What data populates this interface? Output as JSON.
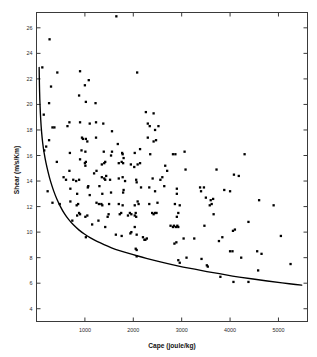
{
  "chart_data": {
    "type": "scatter",
    "title": "",
    "xlabel": "Cape (joule/kg)",
    "ylabel": "Shear (m/s/Km)",
    "xlim": [
      0,
      5600
    ],
    "ylim": [
      3.0,
      27.2
    ],
    "xticks": [
      1000,
      2000,
      3000,
      4000,
      5000
    ],
    "xticklabels": [
      "1000",
      "2000",
      "3000",
      "4000",
      "5000"
    ],
    "yticks": [
      4,
      6,
      8,
      10,
      12,
      14,
      16,
      18,
      20,
      22,
      24,
      26
    ],
    "yticklabels": [
      "4",
      "6",
      "8",
      "10",
      "12",
      "14",
      "16",
      "18",
      "20",
      "22",
      "24",
      "26"
    ],
    "grid": false,
    "legend": null,
    "frame": "box-all-sides-with-inward-ticks",
    "marker": "filled-square",
    "marker_color": "#000000",
    "series": [
      {
        "name": "observations",
        "points": [
          [
            1650,
            26.9
          ],
          [
            270,
            25.1
          ],
          [
            120,
            22.9
          ],
          [
            430,
            22.5
          ],
          [
            900,
            22.6
          ],
          [
            2080,
            22.5
          ],
          [
            1000,
            21.5
          ],
          [
            1080,
            21.9
          ],
          [
            300,
            21.4
          ],
          [
            880,
            20.7
          ],
          [
            1020,
            20.2
          ],
          [
            1220,
            20.1
          ],
          [
            260,
            20.1
          ],
          [
            150,
            19.2
          ],
          [
            680,
            18.6
          ],
          [
            900,
            18.6
          ],
          [
            1100,
            18.5
          ],
          [
            1230,
            18.6
          ],
          [
            330,
            18.2
          ],
          [
            370,
            18.2
          ],
          [
            640,
            18.3
          ],
          [
            1380,
            18.5
          ],
          [
            2300,
            18.5
          ],
          [
            2340,
            18.3
          ],
          [
            2520,
            18.3
          ],
          [
            2260,
            19.4
          ],
          [
            2420,
            19.3
          ],
          [
            2450,
            18.0
          ],
          [
            1560,
            17.9
          ],
          [
            940,
            17.4
          ],
          [
            960,
            17.3
          ],
          [
            1020,
            17.3
          ],
          [
            1050,
            17.1
          ],
          [
            260,
            17.2
          ],
          [
            200,
            16.7
          ],
          [
            1230,
            17.4
          ],
          [
            2300,
            17.4
          ],
          [
            2420,
            17.1
          ],
          [
            2470,
            17.2
          ],
          [
            1680,
            16.9
          ],
          [
            160,
            16.4
          ],
          [
            930,
            16.4
          ],
          [
            1010,
            16.3
          ],
          [
            690,
            16.2
          ],
          [
            1390,
            16.3
          ],
          [
            1560,
            16.3
          ],
          [
            1770,
            16.2
          ],
          [
            1780,
            16.1
          ],
          [
            2030,
            16.2
          ],
          [
            2350,
            16.1
          ],
          [
            2820,
            16.1
          ],
          [
            2870,
            16.1
          ],
          [
            3060,
            16.3
          ],
          [
            4300,
            16.1
          ],
          [
            420,
            15.5
          ],
          [
            900,
            15.7
          ],
          [
            1000,
            15.4
          ],
          [
            1010,
            15.2
          ],
          [
            1020,
            15.5
          ],
          [
            1350,
            15.3
          ],
          [
            1400,
            15.4
          ],
          [
            1420,
            15.5
          ],
          [
            1700,
            15.4
          ],
          [
            1760,
            15.5
          ],
          [
            1790,
            15.4
          ],
          [
            1950,
            15.3
          ],
          [
            2020,
            15.1
          ],
          [
            2090,
            15.3
          ],
          [
            2140,
            15.4
          ],
          [
            2660,
            15.2
          ],
          [
            2700,
            14.8
          ],
          [
            3080,
            14.9
          ],
          [
            3720,
            14.9
          ],
          [
            4080,
            14.5
          ],
          [
            4180,
            14.4
          ],
          [
            560,
            14.3
          ],
          [
            610,
            14.1
          ],
          [
            760,
            14.1
          ],
          [
            820,
            14.0
          ],
          [
            880,
            14.1
          ],
          [
            1060,
            13.5
          ],
          [
            1070,
            13.6
          ],
          [
            1300,
            13.6
          ],
          [
            1350,
            14.3
          ],
          [
            1400,
            14.2
          ],
          [
            1420,
            14.1
          ],
          [
            1440,
            14.4
          ],
          [
            1520,
            14.1
          ],
          [
            1700,
            14.2
          ],
          [
            1780,
            14.3
          ],
          [
            1830,
            14.0
          ],
          [
            2060,
            14.1
          ],
          [
            2070,
            13.9
          ],
          [
            2400,
            14.2
          ],
          [
            2600,
            14.3
          ],
          [
            2640,
            13.6
          ],
          [
            2900,
            13.4
          ],
          [
            3380,
            13.5
          ],
          [
            3400,
            13.2
          ],
          [
            3460,
            13.5
          ],
          [
            3880,
            13.3
          ],
          [
            4000,
            13.2
          ],
          [
            230,
            13.2
          ],
          [
            700,
            13.4
          ],
          [
            840,
            13.0
          ],
          [
            1360,
            13.0
          ],
          [
            1790,
            13.1
          ],
          [
            1800,
            13.3
          ],
          [
            2160,
            13.5
          ],
          [
            2330,
            13.5
          ],
          [
            2450,
            13.2
          ],
          [
            2900,
            13.0
          ],
          [
            3500,
            12.7
          ],
          [
            3600,
            12.5
          ],
          [
            3650,
            12.6
          ],
          [
            4600,
            12.5
          ],
          [
            4900,
            12.1
          ],
          [
            330,
            12.3
          ],
          [
            480,
            12.2
          ],
          [
            830,
            12.1
          ],
          [
            1240,
            12.3
          ],
          [
            1290,
            12.2
          ],
          [
            1340,
            12.2
          ],
          [
            1360,
            12.1
          ],
          [
            1500,
            12.2
          ],
          [
            1700,
            12.2
          ],
          [
            1780,
            12.1
          ],
          [
            2030,
            12.1
          ],
          [
            2090,
            12.4
          ],
          [
            2110,
            12.2
          ],
          [
            2330,
            12.2
          ],
          [
            2500,
            12.3
          ],
          [
            2860,
            12.2
          ],
          [
            2960,
            12.1
          ],
          [
            3580,
            12.1
          ],
          [
            3620,
            12.2
          ],
          [
            840,
            11.3
          ],
          [
            880,
            11.5
          ],
          [
            900,
            11.4
          ],
          [
            1010,
            11.2
          ],
          [
            1050,
            11.3
          ],
          [
            1470,
            11.2
          ],
          [
            1490,
            11.4
          ],
          [
            1720,
            11.4
          ],
          [
            1750,
            11.5
          ],
          [
            1890,
            11.3
          ],
          [
            1930,
            11.5
          ],
          [
            1960,
            11.4
          ],
          [
            2030,
            11.3
          ],
          [
            2050,
            11.5
          ],
          [
            2060,
            11.2
          ],
          [
            2390,
            11.5
          ],
          [
            2420,
            11.4
          ],
          [
            2450,
            11.5
          ],
          [
            2480,
            11.5
          ],
          [
            2900,
            11.2
          ],
          [
            2930,
            11.5
          ],
          [
            3660,
            11.4
          ],
          [
            4380,
            10.8
          ],
          [
            740,
            10.9
          ],
          [
            1150,
            10.6
          ],
          [
            1280,
            10.9
          ],
          [
            1420,
            10.4
          ],
          [
            2030,
            10.4
          ],
          [
            2770,
            10.5
          ],
          [
            2820,
            10.4
          ],
          [
            2840,
            10.5
          ],
          [
            2880,
            10.4
          ],
          [
            2910,
            10.5
          ],
          [
            2930,
            10.4
          ],
          [
            3470,
            10.5
          ],
          [
            4060,
            10.1
          ],
          [
            4100,
            10.2
          ],
          [
            1640,
            9.8
          ],
          [
            1760,
            9.7
          ],
          [
            1940,
            9.9
          ],
          [
            1960,
            10.0
          ],
          [
            2070,
            9.8
          ],
          [
            2200,
            9.6
          ],
          [
            2230,
            9.4
          ],
          [
            2250,
            9.4
          ],
          [
            2280,
            9.5
          ],
          [
            1020,
            9.6
          ],
          [
            2850,
            9.1
          ],
          [
            2890,
            9.2
          ],
          [
            3040,
            9.5
          ],
          [
            3260,
            9.5
          ],
          [
            3770,
            9.3
          ],
          [
            3840,
            9.6
          ],
          [
            4000,
            8.5
          ],
          [
            4050,
            8.5
          ],
          [
            4560,
            8.5
          ],
          [
            4650,
            8.3
          ],
          [
            2050,
            8.7
          ],
          [
            2070,
            8.6
          ],
          [
            2070,
            8.1
          ],
          [
            2930,
            7.8
          ],
          [
            2960,
            7.6
          ],
          [
            3100,
            8.0
          ],
          [
            3410,
            7.9
          ],
          [
            3520,
            7.4
          ],
          [
            3540,
            7.3
          ],
          [
            4580,
            7.0
          ],
          [
            5250,
            7.5
          ],
          [
            3800,
            6.5
          ],
          [
            4070,
            6.1
          ],
          [
            4380,
            6.1
          ],
          [
            5050,
            9.7
          ],
          [
            4230,
            8.0
          ],
          [
            1540,
            16.0
          ],
          [
            2140,
            16.5
          ],
          [
            2560,
            14.1
          ],
          [
            1800,
            15.8
          ],
          [
            1540,
            13.1
          ],
          [
            1100,
            12.9
          ],
          [
            1190,
            14.6
          ],
          [
            1240,
            14.8
          ],
          [
            680,
            14.8
          ],
          [
            700,
            12.4
          ],
          [
            860,
            12.2
          ]
        ]
      }
    ],
    "fit_curve": {
      "name": "lower-bound envelope",
      "style": "solid-black-line",
      "description": "monotonically decreasing hyperbolic-like curve from ~22.9 at the left axis down to ~5.9 at the right axis",
      "points": [
        [
          55,
          22.9
        ],
        [
          60,
          21.6
        ],
        [
          68,
          20.4
        ],
        [
          80,
          19.3
        ],
        [
          95,
          18.3
        ],
        [
          115,
          17.4
        ],
        [
          140,
          16.6
        ],
        [
          175,
          15.8
        ],
        [
          215,
          15.1
        ],
        [
          265,
          14.3
        ],
        [
          320,
          13.6
        ],
        [
          385,
          12.9
        ],
        [
          455,
          12.3
        ],
        [
          535,
          11.7
        ],
        [
          620,
          11.2
        ],
        [
          715,
          10.75
        ],
        [
          820,
          10.35
        ],
        [
          930,
          10.0
        ],
        [
          1050,
          9.7
        ],
        [
          1180,
          9.4
        ],
        [
          1320,
          9.15
        ],
        [
          1470,
          8.9
        ],
        [
          1630,
          8.65
        ],
        [
          1800,
          8.45
        ],
        [
          1980,
          8.25
        ],
        [
          2170,
          8.05
        ],
        [
          2370,
          7.85
        ],
        [
          2580,
          7.65
        ],
        [
          2800,
          7.45
        ],
        [
          3030,
          7.25
        ],
        [
          3270,
          7.1
        ],
        [
          3520,
          6.9
        ],
        [
          3780,
          6.75
        ],
        [
          4050,
          6.55
        ],
        [
          4330,
          6.4
        ],
        [
          4620,
          6.25
        ],
        [
          4920,
          6.1
        ],
        [
          5230,
          5.95
        ],
        [
          5480,
          5.85
        ]
      ]
    }
  }
}
